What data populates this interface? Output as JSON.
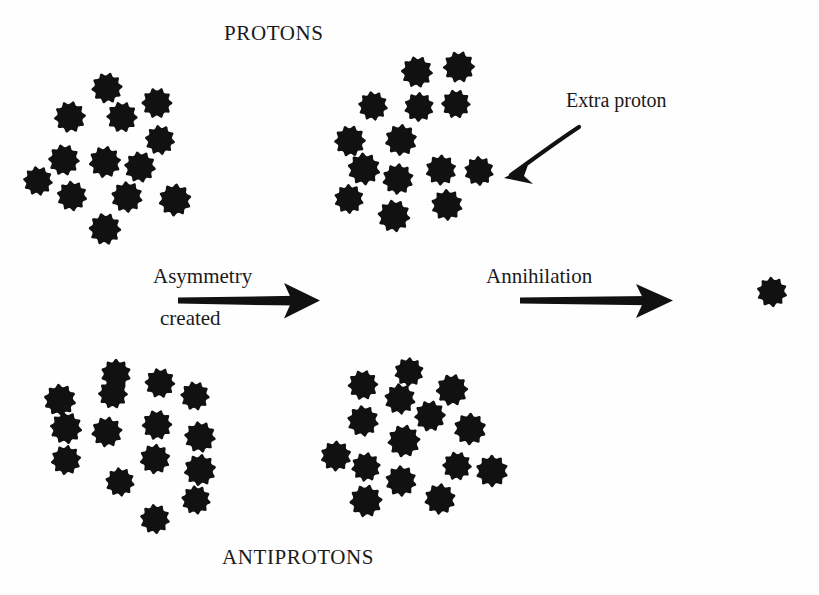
{
  "figure": {
    "background_color": "#fefefe",
    "ink_color": "#111111",
    "width": 819,
    "height": 595,
    "top_label": "PROTONS",
    "bottom_label": "ANTIPROTONS"
  },
  "labels": {
    "protons": "PROTONS",
    "antiprotons": "ANTIPROTONS",
    "asymmetry_line1": "Asymmetry",
    "asymmetry_line2": "created",
    "annihilation": "Annihilation",
    "extra_proton": "Extra proton"
  },
  "diagram_data": {
    "type": "conceptual-physics-diagram",
    "description": "Baryogenesis schematic: equal numbers of protons and antiprotons acquire an asymmetry (one extra proton), then annihilate, leaving a single surviving proton.",
    "stages": [
      {
        "id": "stage-1",
        "name": "initial-symmetric-state",
        "proton_count": 13,
        "antiproton_count": 15
      },
      {
        "id": "stage-2",
        "name": "asymmetry-created",
        "proton_count": 14,
        "antiproton_count": 15,
        "note": "Extra proton"
      },
      {
        "id": "stage-3",
        "name": "after-annihilation",
        "proton_count": 1,
        "antiproton_count": 0
      }
    ],
    "particle": {
      "shape": "scalloped-gear-blob",
      "lobes": 10,
      "color": "#111111",
      "diameter_px": 31
    },
    "clusters": [
      {
        "name": "protons-initial",
        "row": "protons",
        "particles": [
          [
            107,
            88
          ],
          [
            157,
            103
          ],
          [
            70,
            117
          ],
          [
            122,
            117
          ],
          [
            160,
            140
          ],
          [
            64,
            160
          ],
          [
            105,
            162
          ],
          [
            140,
            167
          ],
          [
            38,
            181
          ],
          [
            72,
            196
          ],
          [
            127,
            197
          ],
          [
            175,
            200
          ],
          [
            105,
            229
          ]
        ]
      },
      {
        "name": "protons-asymmetric",
        "row": "protons",
        "particles": [
          [
            417,
            72
          ],
          [
            459,
            67
          ],
          [
            373,
            106
          ],
          [
            419,
            107
          ],
          [
            456,
            104
          ],
          [
            350,
            141
          ],
          [
            401,
            140
          ],
          [
            364,
            169
          ],
          [
            441,
            170
          ],
          [
            479,
            171
          ],
          [
            398,
            179
          ],
          [
            349,
            199
          ],
          [
            394,
            216
          ],
          [
            447,
            205
          ]
        ]
      },
      {
        "name": "antiprotons-initial",
        "row": "antiprotons",
        "particles": [
          [
            116,
            374
          ],
          [
            113,
            394
          ],
          [
            160,
            383
          ],
          [
            60,
            400
          ],
          [
            195,
            396
          ],
          [
            66,
            428
          ],
          [
            157,
            425
          ],
          [
            107,
            432
          ],
          [
            200,
            437
          ],
          [
            66,
            460
          ],
          [
            155,
            459
          ],
          [
            200,
            470
          ],
          [
            120,
            482
          ],
          [
            196,
            500
          ],
          [
            155,
            519
          ]
        ]
      },
      {
        "name": "antiprotons-second",
        "row": "antiprotons",
        "particles": [
          [
            409,
            372
          ],
          [
            363,
            385
          ],
          [
            400,
            399
          ],
          [
            452,
            390
          ],
          [
            363,
            421
          ],
          [
            430,
            416
          ],
          [
            470,
            429
          ],
          [
            404,
            441
          ],
          [
            336,
            456
          ],
          [
            366,
            467
          ],
          [
            457,
            466
          ],
          [
            492,
            471
          ],
          [
            401,
            481
          ],
          [
            366,
            501
          ],
          [
            440,
            499
          ]
        ]
      },
      {
        "name": "surviving-proton",
        "row": "result",
        "particles": [
          [
            772,
            292
          ]
        ]
      }
    ],
    "arrows": [
      {
        "name": "asymmetry-arrow",
        "label": "Asymmetry created",
        "from": [
          178,
          301
        ],
        "to": [
          318,
          301
        ],
        "style": "thick-tapered-shaft-open-head"
      },
      {
        "name": "annihilation-arrow",
        "label": "Annihilation",
        "from": [
          520,
          301
        ],
        "to": [
          672,
          301
        ],
        "style": "thick-tapered-shaft-open-head"
      },
      {
        "name": "extra-proton-pointer",
        "label": "Extra proton",
        "from": [
          578,
          128
        ],
        "to": [
          506,
          176
        ],
        "style": "thin-curved-open-head"
      }
    ]
  }
}
